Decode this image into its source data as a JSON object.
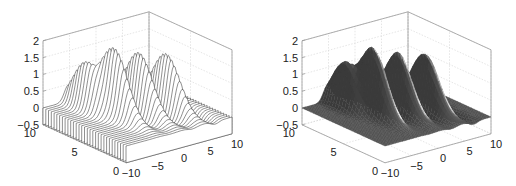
{
  "figure": {
    "panels": [
      {
        "name": "waterfall-plot",
        "label": "Waterfall plot"
      },
      {
        "name": "surface-plot",
        "label": "Surface plot"
      }
    ]
  },
  "chart_data": [
    {
      "type": "waterfall",
      "title": "",
      "xlabel": "",
      "ylabel": "",
      "zlabel": "",
      "xlim": [
        -10,
        10
      ],
      "ylim": [
        0,
        10
      ],
      "zlim": [
        -0.5,
        2
      ],
      "xticks": [
        -10,
        -5,
        0,
        5,
        10
      ],
      "xtick_labels": [
        "−10",
        "−5",
        "0",
        "5",
        "10"
      ],
      "yticks": [
        0,
        5,
        10
      ],
      "ytick_labels": [
        "0",
        "5",
        "10"
      ],
      "zticks": [
        -0.5,
        0,
        0.5,
        1,
        1.5,
        2
      ],
      "ztick_labels": [
        "−0.5",
        "0",
        "0.5",
        "1",
        "1.5",
        "2"
      ],
      "grid": true,
      "peaks": [
        {
          "x": -5,
          "y": 8,
          "z": 1.3
        },
        {
          "x": -4,
          "y": 5,
          "z": 2.0
        },
        {
          "x": 0,
          "y": 5,
          "z": 1.75
        },
        {
          "x": 5,
          "y": 5,
          "z": 1.6
        }
      ],
      "baseline": 0,
      "line_color": "#333333"
    },
    {
      "type": "surface",
      "title": "",
      "xlabel": "",
      "ylabel": "",
      "zlabel": "",
      "xlim": [
        -10,
        10
      ],
      "ylim": [
        0,
        10
      ],
      "zlim": [
        -0.5,
        2
      ],
      "xticks": [
        -10,
        -5,
        0,
        5,
        10
      ],
      "xtick_labels": [
        "−10",
        "−5",
        "0",
        "5",
        "10"
      ],
      "yticks": [
        0,
        5,
        10
      ],
      "ytick_labels": [
        "0",
        "5",
        "10"
      ],
      "zticks": [
        -0.5,
        0,
        0.5,
        1,
        1.5,
        2
      ],
      "ztick_labels": [
        "−0.5",
        "0",
        "0.5",
        "1",
        "1.5",
        "2"
      ],
      "grid": true,
      "peaks": [
        {
          "x": -5,
          "y": 8,
          "z": 1.3
        },
        {
          "x": -4,
          "y": 5,
          "z": 2.0
        },
        {
          "x": 0,
          "y": 5,
          "z": 1.75
        },
        {
          "x": 5,
          "y": 5,
          "z": 1.6
        }
      ],
      "surface_color": "#4a4a4a",
      "highlight_color": "#e8e8e8"
    }
  ],
  "style": {
    "grid_color": "#d4d4d4",
    "axis_color": "#9a9a9a",
    "text_color": "#222222"
  }
}
